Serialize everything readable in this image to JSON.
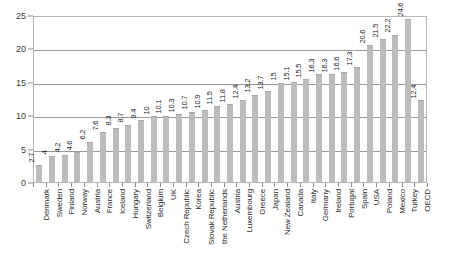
{
  "chart_data": {
    "type": "bar",
    "title": "",
    "subtitle": "",
    "xlabel": "",
    "ylabel": "",
    "ylim": [
      0,
      25
    ],
    "yticks": [
      0,
      5,
      10,
      15,
      20,
      25
    ],
    "ytick_labels": [
      "0",
      "5",
      "10",
      "15",
      "20",
      "25"
    ],
    "grid": true,
    "legend": false,
    "legend_position": "none",
    "orientation": "vertical",
    "bar_color": "#bcbcbc",
    "categories": [
      "Denmark",
      "Sweden",
      "Finland",
      "Norway",
      "Austria",
      "France",
      "Iceland",
      "Hungary",
      "Switzerland",
      "Belgium",
      "UK",
      "Czech Republic",
      "Korea",
      "Slovak Republic",
      "the Netherlands",
      "Austria",
      "Luxembourg",
      "Greece",
      "Japan",
      "New Zealand",
      "Canada",
      "Italy",
      "Germany",
      "Ireland",
      "Portugal",
      "Spain",
      "USA",
      "Poland",
      "Mexico",
      "Turkey",
      "OECD"
    ],
    "values": [
      2.7,
      4,
      4.2,
      4.6,
      6.2,
      7.6,
      8.3,
      8.7,
      9.4,
      10,
      10.1,
      10.3,
      10.7,
      10.9,
      11.5,
      11.8,
      12.4,
      13.2,
      13.7,
      15,
      15.1,
      15.5,
      16.3,
      16.3,
      16.6,
      17.3,
      20.6,
      21.5,
      22.2,
      24.6,
      12.4
    ],
    "value_labels": [
      "2.7",
      "4",
      "4.2",
      "4.6",
      "6.2",
      "7.6",
      "8.3",
      "8.7",
      "9.4",
      "10",
      "10.1",
      "10.3",
      "10.7",
      "10.9",
      "11.5",
      "11.8",
      "12.4",
      "13.2",
      "13.7",
      "15",
      "15.1",
      "15.5",
      "16.3",
      "16.3",
      "16.6",
      "17.3",
      "20.6",
      "21.5",
      "22.2",
      "24.6",
      "12.4"
    ]
  }
}
